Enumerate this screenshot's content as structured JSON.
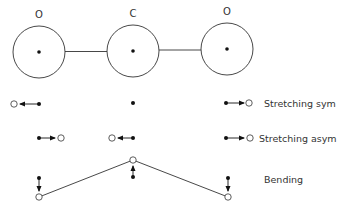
{
  "diagram": {
    "colors": {
      "stroke": "#333333",
      "dot": "#111111",
      "text": "#333333",
      "background": "#ffffff"
    },
    "atoms": [
      {
        "label": "O",
        "cx": 39,
        "cy": 52,
        "r": 26,
        "label_x": 39,
        "label_y": 18
      },
      {
        "label": "C",
        "cx": 133,
        "cy": 51,
        "r": 26,
        "label_x": 133,
        "label_y": 17
      },
      {
        "label": "O",
        "cx": 227,
        "cy": 49,
        "r": 26,
        "label_x": 227,
        "label_y": 15
      }
    ],
    "modes": [
      {
        "name": "stretching-sym",
        "label": "Stretching sym",
        "label_x": 264,
        "label_y": 107
      },
      {
        "name": "stretching-asym",
        "label": "Stretching asym",
        "label_x": 259,
        "label_y": 142
      },
      {
        "name": "bending",
        "label": "Bending",
        "label_x": 264,
        "label_y": 183
      }
    ]
  }
}
